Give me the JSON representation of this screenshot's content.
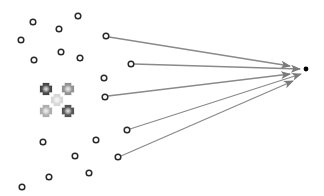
{
  "diagram": {
    "width": 324,
    "height": 196,
    "background": "#ffffff",
    "node_style": {
      "radius": 2.8,
      "stroke": "#2a2a2a",
      "stroke_width": 1.5,
      "fill": "#ffffff"
    },
    "arrow_style": {
      "stroke": "#8a8a8a",
      "stroke_width": 1.3,
      "head_color": "#7a7a7a"
    },
    "target": {
      "x": 306,
      "y": 69,
      "r": 2.4,
      "color": "#000000"
    },
    "nodes": [
      {
        "x": 33,
        "y": 22,
        "role": "unconnected"
      },
      {
        "x": 78,
        "y": 16,
        "role": "unconnected"
      },
      {
        "x": 59,
        "y": 29,
        "role": "unconnected"
      },
      {
        "x": 21,
        "y": 40,
        "role": "unconnected"
      },
      {
        "x": 61,
        "y": 52,
        "role": "unconnected"
      },
      {
        "x": 80,
        "y": 58,
        "role": "unconnected"
      },
      {
        "x": 34,
        "y": 60,
        "role": "unconnected"
      },
      {
        "x": 104,
        "y": 78,
        "role": "unconnected"
      },
      {
        "x": 43,
        "y": 142,
        "role": "unconnected"
      },
      {
        "x": 96,
        "y": 140,
        "role": "unconnected"
      },
      {
        "x": 75,
        "y": 156,
        "role": "unconnected"
      },
      {
        "x": 89,
        "y": 173,
        "role": "unconnected"
      },
      {
        "x": 49,
        "y": 177,
        "role": "unconnected"
      },
      {
        "x": 22,
        "y": 187,
        "role": "unconnected"
      },
      {
        "x": 106,
        "y": 36,
        "role": "source"
      },
      {
        "x": 131,
        "y": 64,
        "role": "source"
      },
      {
        "x": 105,
        "y": 97,
        "role": "source"
      },
      {
        "x": 127,
        "y": 130,
        "role": "source"
      },
      {
        "x": 118,
        "y": 157,
        "role": "source"
      }
    ],
    "arrows": [
      {
        "from": [
          109,
          37
        ],
        "to": [
          290,
          66
        ]
      },
      {
        "from": [
          134,
          64
        ],
        "to": [
          300,
          69
        ]
      },
      {
        "from": [
          108,
          96
        ],
        "to": [
          290,
          74
        ]
      },
      {
        "from": [
          130,
          129
        ],
        "to": [
          301,
          74
        ]
      },
      {
        "from": [
          121,
          156
        ],
        "to": [
          293,
          81
        ]
      }
    ],
    "cluster": [
      {
        "x": 46,
        "y": 89,
        "shade": "#3a3a3a",
        "name": "cluster-marker-top-left"
      },
      {
        "x": 68,
        "y": 89,
        "shade": "#8a8a8a",
        "name": "cluster-marker-top-right"
      },
      {
        "x": 57,
        "y": 100,
        "shade": "#d4d4d4",
        "name": "cluster-marker-center"
      },
      {
        "x": 46,
        "y": 111,
        "shade": "#a8a8a8",
        "name": "cluster-marker-bottom-left"
      },
      {
        "x": 68,
        "y": 111,
        "shade": "#4a4a4a",
        "name": "cluster-marker-bottom-right"
      }
    ]
  }
}
